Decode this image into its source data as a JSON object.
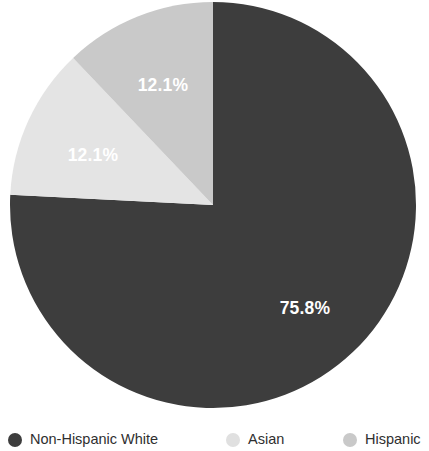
{
  "chart_data": {
    "type": "pie",
    "title": "",
    "subtitle": "",
    "xlabel": "",
    "ylabel": "",
    "legend_position": "bottom",
    "grid": false,
    "categories": [
      "Non-Hispanic White",
      "Asian",
      "Hispanic"
    ],
    "values": [
      75.8,
      12.1,
      12.1
    ],
    "slices": [
      {
        "label": "Non-Hispanic White",
        "value": 75.8,
        "value_text": "75.8%",
        "color": "#3d3d3d",
        "label_color": "#ffffff",
        "start_angle_deg": 0,
        "end_angle_deg": 272.88
      },
      {
        "label": "Asian",
        "value": 12.1,
        "value_text": "12.1%",
        "color": "#e4e4e4",
        "label_color": "#ffffff",
        "start_angle_deg": 272.88,
        "end_angle_deg": 316.44
      },
      {
        "label": "Hispanic",
        "value": 12.1,
        "value_text": "12.1%",
        "color": "#c9c9c9",
        "label_color": "#ffffff",
        "start_angle_deg": 316.44,
        "end_angle_deg": 360
      }
    ],
    "legend": [
      {
        "label": "Non-Hispanic White",
        "color": "#3d3d3d"
      },
      {
        "label": "Asian",
        "color": "#e0e0e0"
      },
      {
        "label": "Hispanic",
        "color": "#c9c9c9"
      }
    ],
    "labels_on_slices": [
      {
        "text": "75.8%",
        "x": 305,
        "y": 314
      },
      {
        "text": "12.1%",
        "x": 93,
        "y": 161
      },
      {
        "text": "12.1%",
        "x": 163,
        "y": 91
      }
    ],
    "geometry": {
      "cx": 213,
      "cy": 205,
      "r": 203
    },
    "background_color": "#ffffff"
  }
}
